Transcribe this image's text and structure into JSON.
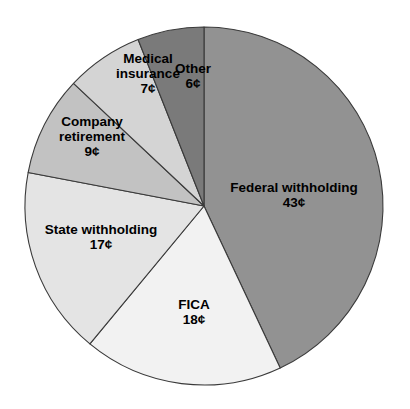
{
  "chart_data": {
    "type": "pie",
    "title": "",
    "subtitle": "",
    "xlabel": "",
    "ylabel": "",
    "unit": "¢",
    "total": 100,
    "legend_position": "none",
    "grid": false,
    "start_angle_deg": 0,
    "direction": "clockwise",
    "categories": [
      "Federal withholding",
      "FICA",
      "State withholding",
      "Company retirement",
      "Medical insurance",
      "Other"
    ],
    "values": [
      43,
      18,
      17,
      9,
      7,
      6
    ],
    "value_labels": [
      "43¢",
      "18¢",
      "17¢",
      "9¢",
      "7¢",
      "6¢"
    ],
    "colors": [
      "#929292",
      "#f2f2f2",
      "#e4e4e4",
      "#c2c2c2",
      "#d4d4d4",
      "#7a7a7a"
    ],
    "slices": [
      {
        "name": "federal-withholding",
        "label_lines": [
          "Federal withholding"
        ],
        "value_label": "43¢",
        "value": 43,
        "color": "#929292",
        "label_x": 294,
        "label_y": 195
      },
      {
        "name": "fica",
        "label_lines": [
          "FICA"
        ],
        "value_label": "18¢",
        "value": 18,
        "color": "#f2f2f2",
        "label_x": 194,
        "label_y": 312
      },
      {
        "name": "state-withholding",
        "label_lines": [
          "State withholding"
        ],
        "value_label": "17¢",
        "value": 17,
        "color": "#e4e4e4",
        "label_x": 101,
        "label_y": 237
      },
      {
        "name": "company-retirement",
        "label_lines": [
          "Company",
          "retirement"
        ],
        "value_label": "9¢",
        "value": 9,
        "color": "#c2c2c2",
        "label_x": 92,
        "label_y": 137
      },
      {
        "name": "medical-insurance",
        "label_lines": [
          "Medical",
          "insurance"
        ],
        "value_label": "7¢",
        "value": 7,
        "color": "#d4d4d4",
        "label_x": 148,
        "label_y": 74
      },
      {
        "name": "other",
        "label_lines": [
          "Other"
        ],
        "value_label": "6¢",
        "value": 6,
        "color": "#7a7a7a",
        "label_x": 193,
        "label_y": 76
      }
    ],
    "geometry": {
      "cx": 204,
      "cy": 206,
      "r": 179
    }
  }
}
